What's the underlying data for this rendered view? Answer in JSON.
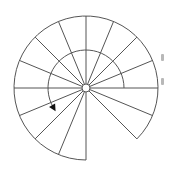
{
  "diagram": {
    "type": "spiral-staircase-plan",
    "center": [
      86,
      88
    ],
    "outer_radius": 72,
    "inner_arrow_radius": 38,
    "newel_radius": 4,
    "tread_angle_deg": 22.5,
    "tread_count": 15,
    "start_angle_deg": -45,
    "end_angle_deg": 270,
    "radial_line_angles_deg": [
      -22.5,
      0,
      22.5,
      45,
      67.5,
      90,
      112.5,
      135,
      157.5,
      180,
      202.5,
      225,
      247.5,
      270
    ],
    "end_edges_deg": [
      -45,
      270
    ],
    "arrow": {
      "start_angle_deg": 0,
      "end_angle_deg": 210,
      "direction": "counterclockwise (ascending)",
      "head": "filled-triangle"
    },
    "stroke_color": "#555555",
    "arrow_color": "#111111",
    "background": "#ffffff",
    "edge_marks": [
      {
        "x": 161,
        "y": 54
      },
      {
        "x": 161,
        "y": 78
      }
    ]
  }
}
